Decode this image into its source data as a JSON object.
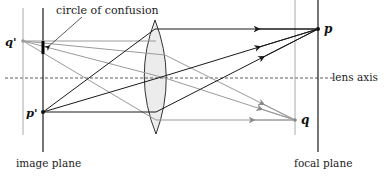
{
  "labels": {
    "circle_of_confusion": "circle of confusion",
    "lens_axis": "lens axis",
    "image_plane": "image plane",
    "focal_plane": "focal plane",
    "point_p": "p",
    "point_q": "q",
    "point_p_prime": "p'",
    "point_q_prime": "q'"
  },
  "colors": {
    "dark_line": "#1a1a1a",
    "light_line": "#9a9a9a",
    "lens_fill": "#ececec",
    "axis_dash": "#333333"
  },
  "geometry": {
    "image_plane_x": 43,
    "q_prime_plane_x": 23,
    "lens_x": 155,
    "q_plane_x": 295,
    "focal_plane_x": 318,
    "axis_y": 78,
    "p": [
      318,
      29
    ],
    "q": [
      295,
      120
    ],
    "p_prime": [
      43,
      112
    ],
    "q_prime": [
      23,
      41
    ]
  }
}
